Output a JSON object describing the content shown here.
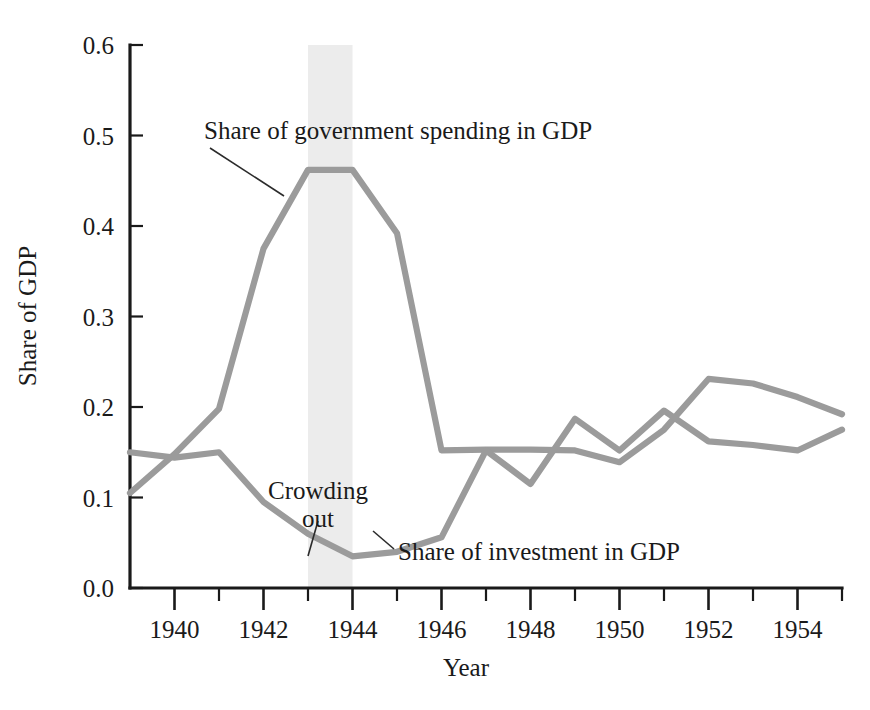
{
  "chart_data": {
    "type": "line",
    "title": "",
    "xlabel": "Year",
    "ylabel": "Share of GDP",
    "xlim": [
      1939,
      1955
    ],
    "ylim": [
      0.0,
      0.6
    ],
    "grid": false,
    "legend_position": "inline-annotations",
    "x": [
      1939,
      1940,
      1941,
      1942,
      1943,
      1944,
      1945,
      1946,
      1947,
      1948,
      1949,
      1950,
      1951,
      1952,
      1953,
      1954,
      1955
    ],
    "xtick_values": [
      1940,
      1942,
      1944,
      1946,
      1948,
      1950,
      1952,
      1954
    ],
    "xtick_labels": [
      "1940",
      "1942",
      "1944",
      "1946",
      "1948",
      "1950",
      "1952",
      "1954"
    ],
    "ytick_values": [
      0.0,
      0.1,
      0.2,
      0.3,
      0.4,
      0.5,
      0.6
    ],
    "ytick_labels": [
      "0.0",
      "0.1",
      "0.2",
      "0.3",
      "0.4",
      "0.5",
      "0.6"
    ],
    "series": [
      {
        "name": "Share of government spending in GDP",
        "color": "#9b9b9b",
        "values": [
          0.105,
          0.148,
          0.198,
          0.375,
          0.462,
          0.462,
          0.392,
          0.152,
          0.153,
          0.153,
          0.152,
          0.139,
          0.175,
          0.231,
          0.226,
          0.211,
          0.192
        ]
      },
      {
        "name": "Share of investment in GDP",
        "color": "#9b9b9b",
        "values": [
          0.15,
          0.144,
          0.15,
          0.095,
          0.06,
          0.035,
          0.04,
          0.056,
          0.152,
          0.115,
          0.187,
          0.152,
          0.196,
          0.162,
          0.158,
          0.152,
          0.175
        ]
      }
    ],
    "shaded_band": {
      "label": "Crowding out",
      "x_start": 1943,
      "x_end": 1944,
      "color": "#ececec"
    },
    "annotations": [
      {
        "text": "Share of government spending in GDP",
        "id": "gov-label"
      },
      {
        "text": "Crowding",
        "id": "crowding-label-line1"
      },
      {
        "text": "out",
        "id": "crowding-label-line2"
      },
      {
        "text": "Share of investment in GDP",
        "id": "inv-label"
      }
    ]
  },
  "axes": {
    "x_title": "Year",
    "y_title": "Share of GDP"
  }
}
